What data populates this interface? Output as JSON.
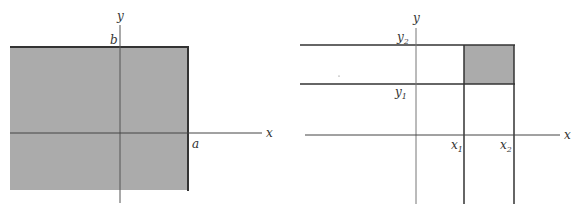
{
  "figures": [
    {
      "id": "left",
      "description": "Shaded half-strip region x <= a, y <= b",
      "axis_labels": {
        "x": "x",
        "y": "y"
      },
      "tick_labels": {
        "a": "a",
        "b": "b"
      },
      "fill_color": "#ababab",
      "line_color": "#333333"
    },
    {
      "id": "right",
      "description": "Shaded rectangle x1 < x <= x2, y1 < y <= y2",
      "axis_labels": {
        "x": "x",
        "y": "y"
      },
      "tick_labels": {
        "x1": {
          "base": "x",
          "sub": "1"
        },
        "x2": {
          "base": "x",
          "sub": "2"
        },
        "y1": {
          "base": "y",
          "sub": "1"
        },
        "y2": {
          "base": "y",
          "sub": "2"
        }
      },
      "fill_color": "#ababab",
      "line_color": "#333333"
    }
  ]
}
